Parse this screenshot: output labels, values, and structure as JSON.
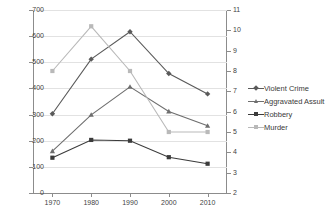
{
  "chart_data": {
    "type": "line",
    "title": "",
    "xlabel": "",
    "ylabel": "",
    "categories": [
      "1970",
      "1980",
      "1990",
      "2000",
      "2010"
    ],
    "grid": true,
    "legend_position": "right",
    "axes": {
      "left": {
        "label": "",
        "ylim": [
          0,
          700
        ],
        "tick_step": 100,
        "ticks": [
          "0",
          "100",
          "200",
          "300",
          "400",
          "500",
          "600",
          "700"
        ]
      },
      "right": {
        "label": "",
        "ylim": [
          2,
          11
        ],
        "tick_step": 1,
        "ticks": [
          "2",
          "3",
          "4",
          "5",
          "6",
          "7",
          "8",
          "9",
          "10",
          "11"
        ]
      }
    },
    "series": [
      {
        "name": "Violent Crime",
        "axis": "left",
        "color": "#5a5a5a",
        "marker": "diamond",
        "values": [
          303,
          512,
          617,
          457,
          379
        ]
      },
      {
        "name": "Aggravated Assult",
        "axis": "left",
        "color": "#6e6e6e",
        "marker": "triangle",
        "values": [
          160,
          299,
          406,
          312,
          257
        ]
      },
      {
        "name": "Robbery",
        "axis": "left",
        "color": "#3b3b3b",
        "marker": "square",
        "values": [
          135,
          203,
          200,
          137,
          112
        ]
      },
      {
        "name": "Murder",
        "axis": "right",
        "color": "#b9b9b9",
        "marker": "square",
        "values": [
          8.0,
          10.2,
          8.0,
          5.0,
          5.0
        ]
      }
    ]
  },
  "legend": {
    "items": [
      {
        "label": "Violent Crime",
        "color": "#5a5a5a"
      },
      {
        "label": "Aggravated Assult",
        "color": "#6e6e6e"
      },
      {
        "label": "Robbery",
        "color": "#3b3b3b"
      },
      {
        "label": "Murder",
        "color": "#b9b9b9"
      }
    ]
  }
}
